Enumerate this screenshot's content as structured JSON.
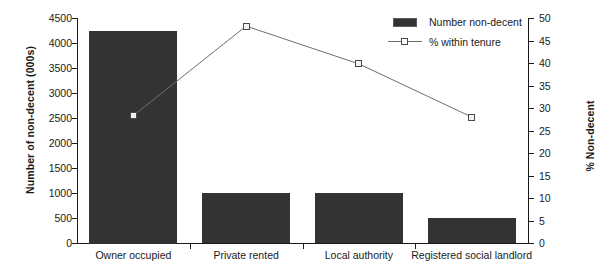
{
  "chart_data": {
    "type": "bar",
    "title": "",
    "categories": [
      "Owner occupied",
      "Private rented",
      "Local authority",
      "Registered social landlord"
    ],
    "series": [
      {
        "name": "Number non-decent",
        "type": "bar",
        "axis": "left",
        "values": [
          4250,
          1000,
          1000,
          500
        ],
        "color": "#333333"
      },
      {
        "name": "% within tenure",
        "type": "line",
        "axis": "right",
        "values": [
          28.3,
          48.2,
          39.8,
          28.0
        ],
        "color": "#6e6e6e"
      }
    ],
    "xlabel": "",
    "ylabel": "Number of non-decent (000s)",
    "y2label": "% Non-decent",
    "ylim": [
      0,
      4500
    ],
    "y2lim": [
      0,
      50
    ],
    "yticks": [
      0,
      500,
      1000,
      1500,
      2000,
      2500,
      3000,
      3500,
      4000,
      4500
    ],
    "y2ticks": [
      0,
      5,
      10,
      15,
      20,
      25,
      30,
      35,
      40,
      45,
      50
    ],
    "grid": false,
    "legend_position": "top-right"
  },
  "legend": {
    "items": [
      {
        "label": "Number non-decent",
        "symbol": "filled-square"
      },
      {
        "label": "% within tenure",
        "symbol": "line-open-square"
      }
    ]
  },
  "axes": {
    "left_title": "Number of non-decent (000s)",
    "right_title": "% Non-decent",
    "left_ticks": [
      "0",
      "500",
      "1000",
      "1500",
      "2000",
      "2500",
      "3000",
      "3500",
      "4000",
      "4500"
    ],
    "right_ticks": [
      "0",
      "5",
      "10",
      "15",
      "20",
      "25",
      "30",
      "35",
      "40",
      "45",
      "50"
    ],
    "category_labels": [
      "Owner occupied",
      "Private rented",
      "Local authority",
      "Registered social landlord"
    ]
  },
  "colors": {
    "bar": "#333333",
    "line": "#6e6e6e",
    "axis": "#1a1a1a",
    "background": "#ffffff"
  }
}
